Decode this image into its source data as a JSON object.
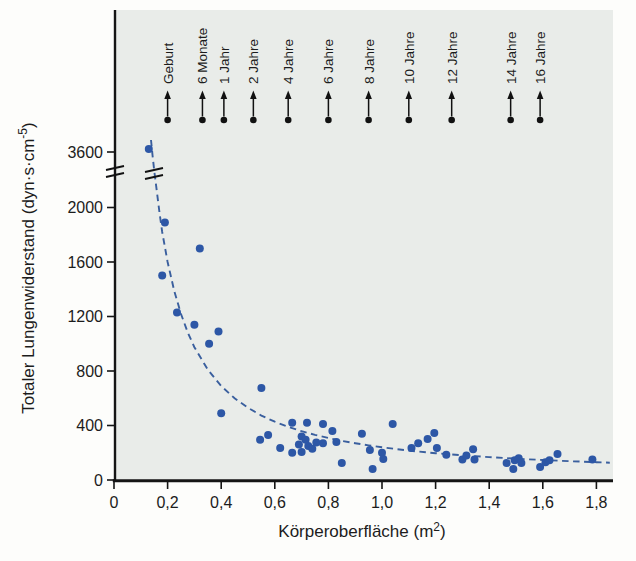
{
  "figure": {
    "page_background": "#fdfdfb",
    "plot_background": "#e9ece9",
    "axis_color": "#151515",
    "point_color": "#2d57a6",
    "curve_color": "#3a5f9e",
    "marker_color": "#111111"
  },
  "chart_data": {
    "type": "scatter",
    "title": "",
    "xlabel": "Körperoberfläche (m²)",
    "xlabel_base": "Körperoberfläche (m",
    "xlabel_sup": "2",
    "xlabel_close": ")",
    "ylabel": "Totaler Lungenwiderstand (dyn·s·cm⁻⁵)",
    "ylabel_base": "Totaler Lungenwiderstand  (dyn·s·cm",
    "ylabel_sup": "-5",
    "ylabel_close": ")",
    "xlim": [
      0,
      1.86
    ],
    "ylim_linear": [
      0,
      2200
    ],
    "grid": false,
    "legend": "none",
    "axis_break": {
      "present": true,
      "between": [
        2000,
        3600
      ],
      "note": "double slash break mark on y-axis and on trend curve"
    },
    "x_ticks": {
      "values": [
        0,
        0.2,
        0.4,
        0.6,
        0.8,
        1.0,
        1.2,
        1.4,
        1.6,
        1.8
      ],
      "labels": [
        "0",
        "0,2",
        "0,4",
        "0,6",
        "0,8",
        "1,0",
        "1,2",
        "1,4",
        "1,6",
        "1,8"
      ]
    },
    "y_ticks": {
      "values": [
        0,
        400,
        800,
        1200,
        1600,
        2000
      ],
      "labels": [
        "0",
        "400",
        "800",
        "1200",
        "1600",
        "2000"
      ]
    },
    "y_break_tick": {
      "value": 3600,
      "label": "3600"
    },
    "age_markers": [
      {
        "label": "Geburt",
        "x": 0.2
      },
      {
        "label": "6 Monate",
        "x": 0.33
      },
      {
        "label": "1 Jahr",
        "x": 0.41
      },
      {
        "label": "2 Jahre",
        "x": 0.52
      },
      {
        "label": "4 Jahre",
        "x": 0.65
      },
      {
        "label": "6 Jahre",
        "x": 0.8
      },
      {
        "label": "8 Jahre",
        "x": 0.95
      },
      {
        "label": "10 Jahre",
        "x": 1.1
      },
      {
        "label": "12 Jahre",
        "x": 1.26
      },
      {
        "label": "14 Jahre",
        "x": 1.48
      },
      {
        "label": "16 Jahre",
        "x": 1.59
      }
    ],
    "points": [
      [
        0.13,
        3630
      ],
      [
        0.18,
        1500
      ],
      [
        0.19,
        1890
      ],
      [
        0.32,
        1700
      ],
      [
        0.235,
        1230
      ],
      [
        0.3,
        1140
      ],
      [
        0.355,
        1000
      ],
      [
        0.39,
        1090
      ],
      [
        0.4,
        490
      ],
      [
        0.55,
        675
      ],
      [
        0.545,
        295
      ],
      [
        0.575,
        330
      ],
      [
        0.62,
        235
      ],
      [
        0.665,
        420
      ],
      [
        0.665,
        200
      ],
      [
        0.69,
        260
      ],
      [
        0.7,
        320
      ],
      [
        0.7,
        205
      ],
      [
        0.715,
        295
      ],
      [
        0.72,
        420
      ],
      [
        0.725,
        250
      ],
      [
        0.74,
        230
      ],
      [
        0.755,
        275
      ],
      [
        0.78,
        410
      ],
      [
        0.78,
        270
      ],
      [
        0.815,
        360
      ],
      [
        0.83,
        280
      ],
      [
        0.85,
        125
      ],
      [
        0.925,
        340
      ],
      [
        0.955,
        220
      ],
      [
        0.965,
        80
      ],
      [
        1.0,
        200
      ],
      [
        1.005,
        155
      ],
      [
        1.04,
        410
      ],
      [
        1.11,
        235
      ],
      [
        1.135,
        270
      ],
      [
        1.17,
        300
      ],
      [
        1.195,
        345
      ],
      [
        1.205,
        235
      ],
      [
        1.24,
        185
      ],
      [
        1.3,
        150
      ],
      [
        1.315,
        180
      ],
      [
        1.34,
        225
      ],
      [
        1.345,
        150
      ],
      [
        1.465,
        125
      ],
      [
        1.49,
        80
      ],
      [
        1.495,
        145
      ],
      [
        1.51,
        160
      ],
      [
        1.52,
        125
      ],
      [
        1.59,
        95
      ],
      [
        1.61,
        130
      ],
      [
        1.625,
        145
      ],
      [
        1.655,
        190
      ],
      [
        1.785,
        150
      ]
    ],
    "trend_curve": {
      "style": "dashed",
      "starts_above_break": true,
      "points": [
        [
          0.17,
          1957
        ],
        [
          0.18,
          1820
        ],
        [
          0.2,
          1600
        ],
        [
          0.225,
          1386
        ],
        [
          0.25,
          1218
        ],
        [
          0.275,
          1084
        ],
        [
          0.3,
          975
        ],
        [
          0.35,
          810
        ],
        [
          0.4,
          690
        ],
        [
          0.45,
          600
        ],
        [
          0.5,
          530
        ],
        [
          0.55,
          473
        ],
        [
          0.6,
          428
        ],
        [
          0.65,
          390
        ],
        [
          0.7,
          358
        ],
        [
          0.75,
          331
        ],
        [
          0.8,
          308
        ],
        [
          0.85,
          287
        ],
        [
          0.9,
          270
        ],
        [
          0.95,
          254
        ],
        [
          1.0,
          240
        ],
        [
          1.1,
          216
        ],
        [
          1.2,
          197
        ],
        [
          1.3,
          181
        ],
        [
          1.4,
          168
        ],
        [
          1.5,
          156
        ],
        [
          1.6,
          147
        ],
        [
          1.7,
          138
        ],
        [
          1.8,
          131
        ],
        [
          1.85,
          127
        ]
      ]
    }
  }
}
